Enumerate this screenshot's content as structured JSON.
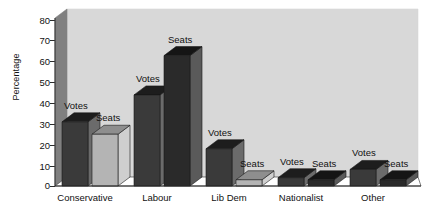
{
  "chart_data": {
    "type": "bar",
    "title": "",
    "xlabel": "",
    "ylabel": "Percentage",
    "ylim": [
      0,
      80
    ],
    "yticks": [
      0,
      10,
      20,
      30,
      40,
      50,
      60,
      70,
      80
    ],
    "grid": false,
    "legend_position": "none",
    "style": "3d-perspective",
    "categories": [
      "Conservative",
      "Labour",
      "Lib Dem",
      "Nationalist",
      "Other"
    ],
    "series": [
      {
        "name": "Votes",
        "values": [
          31,
          44,
          18,
          4,
          8
        ]
      },
      {
        "name": "Seats",
        "values": [
          25,
          63,
          3,
          3,
          3
        ]
      }
    ],
    "bar_labels": {
      "votes": "Votes",
      "seats": "Seats"
    },
    "colors": {
      "votes_face": "#3a3a3a",
      "votes_top": "#1d1d1d",
      "votes_side": "#6b6b6b",
      "seats_face_light": "#b4b4b4",
      "seats_top_light": "#8e8e8e",
      "seats_side_light": "#cfcfcf",
      "seats_face_dark": "#2a2a2a",
      "seats_top_dark": "#151515",
      "seats_side_dark": "#5a5a5a",
      "plot_background": "#d8d8d8",
      "left_wall": "#808080",
      "floor": "#ffffff",
      "axis_line": "#2b2b2b",
      "text": "#111111"
    }
  },
  "axis": {
    "ylabel": "Percentage",
    "ticks": [
      "80",
      "70",
      "60",
      "50",
      "40",
      "30",
      "20",
      "10",
      "0"
    ]
  },
  "categories": [
    {
      "label": "Conservative"
    },
    {
      "label": "Labour"
    },
    {
      "label": "Lib Dem"
    },
    {
      "label": "Nationalist"
    },
    {
      "label": "Other"
    }
  ],
  "bars": [
    {
      "group": "Conservative",
      "series": "Votes",
      "label": "Votes",
      "value": 31
    },
    {
      "group": "Conservative",
      "series": "Seats",
      "label": "Seats",
      "value": 25
    },
    {
      "group": "Labour",
      "series": "Votes",
      "label": "Votes",
      "value": 44
    },
    {
      "group": "Labour",
      "series": "Seats",
      "label": "Seats",
      "value": 63
    },
    {
      "group": "Lib Dem",
      "series": "Votes",
      "label": "Votes",
      "value": 18
    },
    {
      "group": "Lib Dem",
      "series": "Seats",
      "label": "Seats",
      "value": 3
    },
    {
      "group": "Nationalist",
      "series": "Votes",
      "label": "Votes",
      "value": 4
    },
    {
      "group": "Nationalist",
      "series": "Seats",
      "label": "Seats",
      "value": 3
    },
    {
      "group": "Other",
      "series": "Votes",
      "label": "Votes",
      "value": 8
    },
    {
      "group": "Other",
      "series": "Seats",
      "label": "Seats",
      "value": 3
    }
  ]
}
